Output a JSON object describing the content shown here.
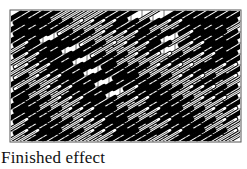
{
  "figure": {
    "caption": "Finished effect",
    "grid": {
      "origin_x": 10,
      "origin_y": 10,
      "cell": 11,
      "cols": 21,
      "rows": 12,
      "line_color": "#555555",
      "background": "#ffffff"
    },
    "colors": {
      "solid": "#000000",
      "hatched_outline": "#000000",
      "hatched_fill": "#ffffff"
    },
    "stitch_style": {
      "direction": "lower-left to upper-right",
      "length_cells": 3,
      "types": [
        "solid",
        "hatched"
      ]
    },
    "rows": [
      "SSSSHHHHSSS.H.SSSSSSS",
      "SSSSSHHHHSSSSHHSSSSSH",
      "SSS.SSSHHHHSSS.HSSSSS",
      "HSSSS.SSHHHHSS.HHSSSS",
      "HHSSSS.SSSHHHHSSHHSSS",
      "HHHSSSS.SSSSHHHHSSHHS",
      "SHHHSSSS.SSSSSHHHSSHH",
      "SSHHHSSSS.HSSSSHHHSSH",
      "SSSHHHSSSSHHSSSSHHHSS",
      "SSSSHHHSSSSHHSSSSHHHS",
      "HSSSSHHHSSSSHHSSSSHHH",
      "HHSSSSHHHSSSSHHSSSSHH"
    ]
  }
}
